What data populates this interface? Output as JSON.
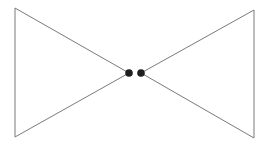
{
  "diagram": {
    "background": "#ffffff",
    "line_color": "#7a7a7a",
    "dot_color": "#1e1e1e",
    "left_triangle": {
      "points": "15,8 15,137 129,73"
    },
    "right_triangle": {
      "points": "254,10 254,138 141,73"
    },
    "nodes": [
      {
        "cx": 129,
        "cy": 73,
        "r": 3.8
      },
      {
        "cx": 141,
        "cy": 73,
        "r": 3.8
      }
    ]
  }
}
